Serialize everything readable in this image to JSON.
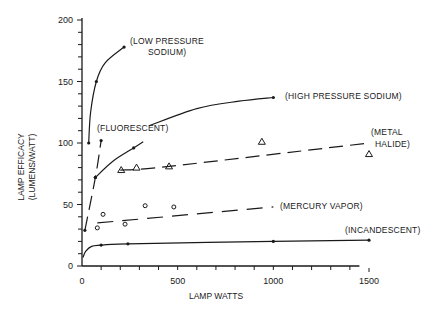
{
  "chart_data": {
    "type": "line",
    "title": "",
    "xlabel": "LAMP WATTS",
    "ylabel_lines": [
      "LAMP EFFICACY",
      "(LUMENS/WATT)"
    ],
    "ylabel": "LAMP EFFICACY (LUMENS/WATT)",
    "xlim": [
      0,
      1500
    ],
    "ylim": [
      0,
      200
    ],
    "x_ticks": [
      0,
      500,
      1000,
      1500
    ],
    "x_tick_labels": [
      "0",
      "500",
      "1000",
      "1500"
    ],
    "x_minor_step": 100,
    "y_ticks": [
      0,
      50,
      100,
      150,
      200
    ],
    "y_tick_labels": [
      "0",
      "50",
      "100",
      "150",
      "200"
    ],
    "y_minor_step": 10,
    "grid": false,
    "legend": "inline labels",
    "series": [
      {
        "name": "(LOW PRESSURE SODIUM)",
        "label_lines": [
          "(LOW PRESSURE",
          "SODIUM)"
        ],
        "style": "solid",
        "curve": [
          [
            35,
            100
          ],
          [
            45,
            125
          ],
          [
            75,
            150
          ],
          [
            120,
            165
          ],
          [
            220,
            178
          ]
        ],
        "markers": [
          [
            35,
            100
          ],
          [
            75,
            150
          ],
          [
            220,
            178
          ]
        ],
        "marker": "dot"
      },
      {
        "name": "(HIGH PRESSURE SODIUM)",
        "label_lines": [
          "(HIGH PRESSURE SODIUM)"
        ],
        "style": "solid",
        "curve": [
          [
            70,
            72
          ],
          [
            150,
            84
          ],
          [
            270,
            96
          ],
          [
            330,
            100
          ],
          [
            350,
            114
          ],
          [
            600,
            127
          ],
          [
            1000,
            137
          ]
        ],
        "markers": [
          [
            70,
            72
          ],
          [
            270,
            96
          ],
          [
            1000,
            137
          ]
        ],
        "marker": "dot"
      },
      {
        "name": "(FLUORESCENT)",
        "label_lines": [
          "(FLUORESCENT)"
        ],
        "style": "dashed",
        "curve": [
          [
            15,
            29
          ],
          [
            70,
            72
          ],
          [
            100,
            102
          ]
        ],
        "markers": [
          [
            15,
            29
          ],
          [
            70,
            72
          ],
          [
            100,
            102
          ]
        ],
        "marker": "dot"
      },
      {
        "name": "(METAL HALIDE)",
        "label_lines": [
          "(METAL",
          "HALIDE)"
        ],
        "style": "dashed",
        "curve": [
          [
            200,
            78
          ],
          [
            455,
            81
          ],
          [
            1500,
            100
          ]
        ],
        "markers": [
          [
            205,
            78
          ],
          [
            285,
            80
          ],
          [
            455,
            81
          ],
          [
            940,
            101
          ],
          [
            1500,
            91
          ]
        ],
        "marker": "triangle"
      },
      {
        "name": "(MERCURY VAPOR)",
        "label_lines": [
          "(MERCURY VAPOR)"
        ],
        "style": "dashed",
        "curve": [
          [
            80,
            35
          ],
          [
            1000,
            48
          ]
        ],
        "markers": [
          [
            80,
            31
          ],
          [
            110,
            42
          ],
          [
            225,
            34
          ],
          [
            330,
            49
          ],
          [
            480,
            48
          ]
        ],
        "marker": "circle"
      },
      {
        "name": "(INCANDESCENT)",
        "label_lines": [
          "(INCANDESCENT)"
        ],
        "style": "solid",
        "curve": [
          [
            5,
            7
          ],
          [
            20,
            12
          ],
          [
            50,
            16
          ],
          [
            100,
            17
          ],
          [
            240,
            18
          ],
          [
            1000,
            20
          ],
          [
            1500,
            21
          ]
        ],
        "markers": [
          [
            100,
            17
          ],
          [
            240,
            18
          ],
          [
            1000,
            20
          ],
          [
            1500,
            21
          ]
        ],
        "marker": "dot"
      }
    ]
  },
  "layout": {
    "ink_color": "#1a1a1a",
    "background": "#ffffff"
  }
}
